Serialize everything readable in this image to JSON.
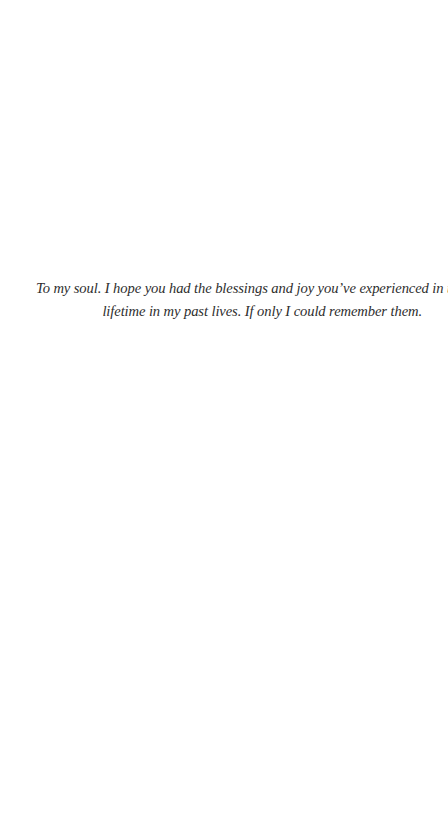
{
  "page": {
    "background": "#ffffff",
    "text_color": "#2e2e2e"
  },
  "dedication": {
    "lines": [
      "To my soul. I hope you had the blessings and joy you’ve experienced in this",
      "lifetime in my past lives. If only I could remember them."
    ]
  }
}
